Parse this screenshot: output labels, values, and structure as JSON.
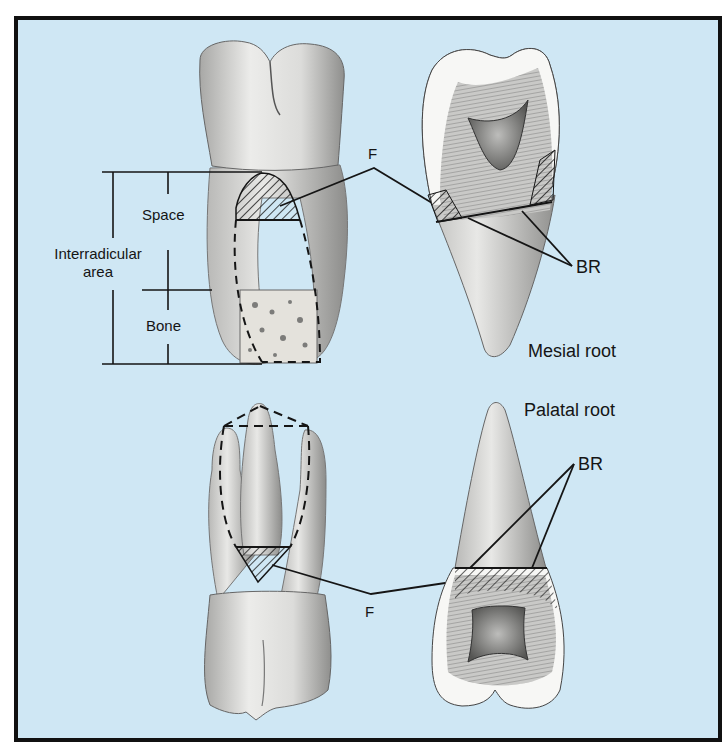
{
  "figure": {
    "background_color": "#cfe7f4",
    "border_color": "#111111",
    "panels": [
      {
        "id": "top-left",
        "view": "maxillary molar, mesial roots with interradicular measurement"
      },
      {
        "id": "top-right",
        "view": "mesial root cross-section"
      },
      {
        "id": "bottom-left",
        "view": "maxillary molar, palatal view with trifurcation"
      },
      {
        "id": "bottom-right",
        "view": "palatal root cross-section"
      }
    ]
  },
  "labels": {
    "space": "Space",
    "interradicular_line1": "Interradicular",
    "interradicular_line2": "area",
    "bone": "Bone",
    "f_top": "F",
    "br_top": "BR",
    "mesial_root": "Mesial root",
    "palatal_root": "Palatal root",
    "br_bottom": "BR",
    "f_bottom": "F"
  },
  "colors": {
    "tooth_fill": "#e6e6e4",
    "tooth_shadow": "#9a9a98",
    "enamel_fill": "#f7f7f5",
    "pulp_fill": "#7a7a78",
    "line": "#151515"
  }
}
